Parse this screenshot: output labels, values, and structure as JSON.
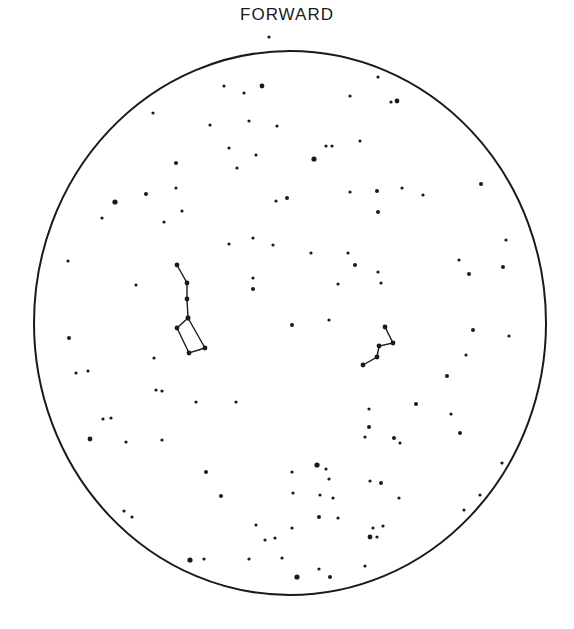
{
  "title": "FORWARD",
  "colors": {
    "ink": "#1a1a1a",
    "background": "#ffffff"
  },
  "field": {
    "cx": 290,
    "cy": 323,
    "rx": 256,
    "ry": 272
  },
  "constellations": [
    {
      "name": "big-dipper",
      "points": [
        [
          177,
          265
        ],
        [
          187,
          283
        ],
        [
          187,
          299
        ],
        [
          188,
          318
        ],
        [
          177,
          328
        ],
        [
          189,
          353
        ],
        [
          205,
          348
        ],
        [
          188,
          318
        ]
      ]
    },
    {
      "name": "right-asterism",
      "points": [
        [
          385,
          327
        ],
        [
          393,
          343
        ],
        [
          379,
          346
        ],
        [
          377,
          357
        ],
        [
          363,
          365
        ]
      ]
    }
  ],
  "stars": [
    [
      269,
      37,
      1.6
    ],
    [
      224,
      86,
      1.6
    ],
    [
      244,
      93,
      1.6
    ],
    [
      262,
      86,
      2.4
    ],
    [
      153,
      113,
      1.6
    ],
    [
      210,
      125,
      1.6
    ],
    [
      249,
      121,
      1.6
    ],
    [
      277,
      126,
      1.6
    ],
    [
      229,
      148,
      1.6
    ],
    [
      256,
      155,
      1.6
    ],
    [
      237,
      168,
      1.6
    ],
    [
      176,
      163,
      2
    ],
    [
      176,
      188,
      1.6
    ],
    [
      146,
      194,
      2
    ],
    [
      115,
      202,
      2.6
    ],
    [
      102,
      218,
      1.6
    ],
    [
      182,
      211,
      1.6
    ],
    [
      164,
      222,
      1.6
    ],
    [
      378,
      77,
      1.6
    ],
    [
      350,
      96,
      1.6
    ],
    [
      391,
      102,
      1.6
    ],
    [
      397,
      101,
      2.4
    ],
    [
      360,
      141,
      1.6
    ],
    [
      326,
      146,
      1.6
    ],
    [
      332,
      146,
      1.6
    ],
    [
      314,
      159,
      2.6
    ],
    [
      287,
      198,
      2
    ],
    [
      276,
      201,
      1.6
    ],
    [
      350,
      192,
      1.6
    ],
    [
      377,
      191,
      2
    ],
    [
      402,
      188,
      1.6
    ],
    [
      423,
      195,
      1.6
    ],
    [
      378,
      212,
      2
    ],
    [
      481,
      184,
      2
    ],
    [
      229,
      244,
      1.6
    ],
    [
      253,
      238,
      1.6
    ],
    [
      273,
      245,
      1.6
    ],
    [
      311,
      253,
      1.6
    ],
    [
      348,
      253,
      1.6
    ],
    [
      355,
      265,
      2
    ],
    [
      338,
      284,
      1.6
    ],
    [
      378,
      272,
      1.6
    ],
    [
      381,
      283,
      1.6
    ],
    [
      253,
      278,
      1.6
    ],
    [
      253,
      289,
      2
    ],
    [
      136,
      285,
      1.6
    ],
    [
      68,
      261,
      1.6
    ],
    [
      459,
      260,
      1.6
    ],
    [
      503,
      267,
      2
    ],
    [
      506,
      240,
      1.6
    ],
    [
      469,
      274,
      2
    ],
    [
      292,
      325,
      2
    ],
    [
      329,
      320,
      1.6
    ],
    [
      473,
      330,
      2
    ],
    [
      509,
      336,
      1.6
    ],
    [
      466,
      355,
      1.6
    ],
    [
      447,
      376,
      2
    ],
    [
      69,
      338,
      2
    ],
    [
      76,
      373,
      1.6
    ],
    [
      88,
      371,
      1.6
    ],
    [
      154,
      358,
      1.6
    ],
    [
      156,
      390,
      1.6
    ],
    [
      162,
      391,
      1.6
    ],
    [
      196,
      402,
      1.6
    ],
    [
      236,
      402,
      1.6
    ],
    [
      416,
      404,
      2
    ],
    [
      369,
      409,
      1.6
    ],
    [
      369,
      427,
      2
    ],
    [
      451,
      414,
      1.6
    ],
    [
      460,
      433,
      2
    ],
    [
      90,
      439,
      2.4
    ],
    [
      103,
      419,
      1.6
    ],
    [
      111,
      418,
      1.6
    ],
    [
      126,
      442,
      1.6
    ],
    [
      162,
      440,
      1.6
    ],
    [
      365,
      437,
      1.6
    ],
    [
      394,
      438,
      2
    ],
    [
      400,
      443,
      1.6
    ],
    [
      206,
      472,
      2
    ],
    [
      221,
      496,
      2
    ],
    [
      124,
      511,
      1.6
    ],
    [
      132,
      517,
      1.6
    ],
    [
      190,
      560,
      2.6
    ],
    [
      204,
      559,
      1.6
    ],
    [
      249,
      559,
      1.6
    ],
    [
      282,
      558,
      1.6
    ],
    [
      292,
      472,
      1.6
    ],
    [
      317,
      465,
      2.6
    ],
    [
      326,
      469,
      1.6
    ],
    [
      329,
      479,
      1.6
    ],
    [
      293,
      493,
      1.6
    ],
    [
      370,
      481,
      1.6
    ],
    [
      381,
      483,
      2
    ],
    [
      383,
      526,
      1.6
    ],
    [
      292,
      528,
      1.6
    ],
    [
      320,
      495,
      1.6
    ],
    [
      333,
      498,
      1.6
    ],
    [
      338,
      518,
      1.6
    ],
    [
      319,
      517,
      2
    ],
    [
      370,
      537,
      2.4
    ],
    [
      373,
      528,
      1.6
    ],
    [
      377,
      537,
      1.6
    ],
    [
      365,
      566,
      1.6
    ],
    [
      399,
      498,
      1.6
    ],
    [
      297,
      577,
      2.6
    ],
    [
      330,
      577,
      2
    ],
    [
      319,
      569,
      1.6
    ],
    [
      265,
      540,
      1.6
    ],
    [
      275,
      538,
      1.6
    ],
    [
      502,
      463,
      1.6
    ],
    [
      480,
      495,
      1.6
    ],
    [
      464,
      510,
      1.6
    ],
    [
      256,
      525,
      1.6
    ]
  ]
}
